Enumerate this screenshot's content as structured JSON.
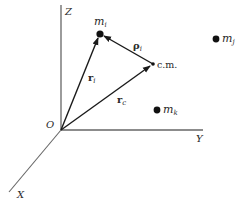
{
  "diagram": {
    "axes": {
      "z_label": "Z",
      "y_label": "Y",
      "x_label": "X",
      "origin_label": "O"
    },
    "masses": [
      {
        "name": "m_i",
        "base": "m",
        "sub": "i"
      },
      {
        "name": "m_j",
        "base": "m",
        "sub": "j"
      },
      {
        "name": "m_k",
        "base": "m",
        "sub": "k"
      }
    ],
    "center_of_mass_label": "c.m.",
    "vectors": [
      {
        "name": "r_i",
        "base": "r",
        "sub": "i",
        "from": "O",
        "to": "m_i"
      },
      {
        "name": "r_c",
        "base": "r",
        "sub": "c",
        "from": "O",
        "to": "c.m."
      },
      {
        "name": "rho_i",
        "base": "ρ",
        "sub": "i",
        "from": "c.m.",
        "to": "m_i"
      }
    ],
    "colors": {
      "line": "#2a2a2a",
      "axis": "#555555",
      "background": "#ffffff"
    }
  }
}
